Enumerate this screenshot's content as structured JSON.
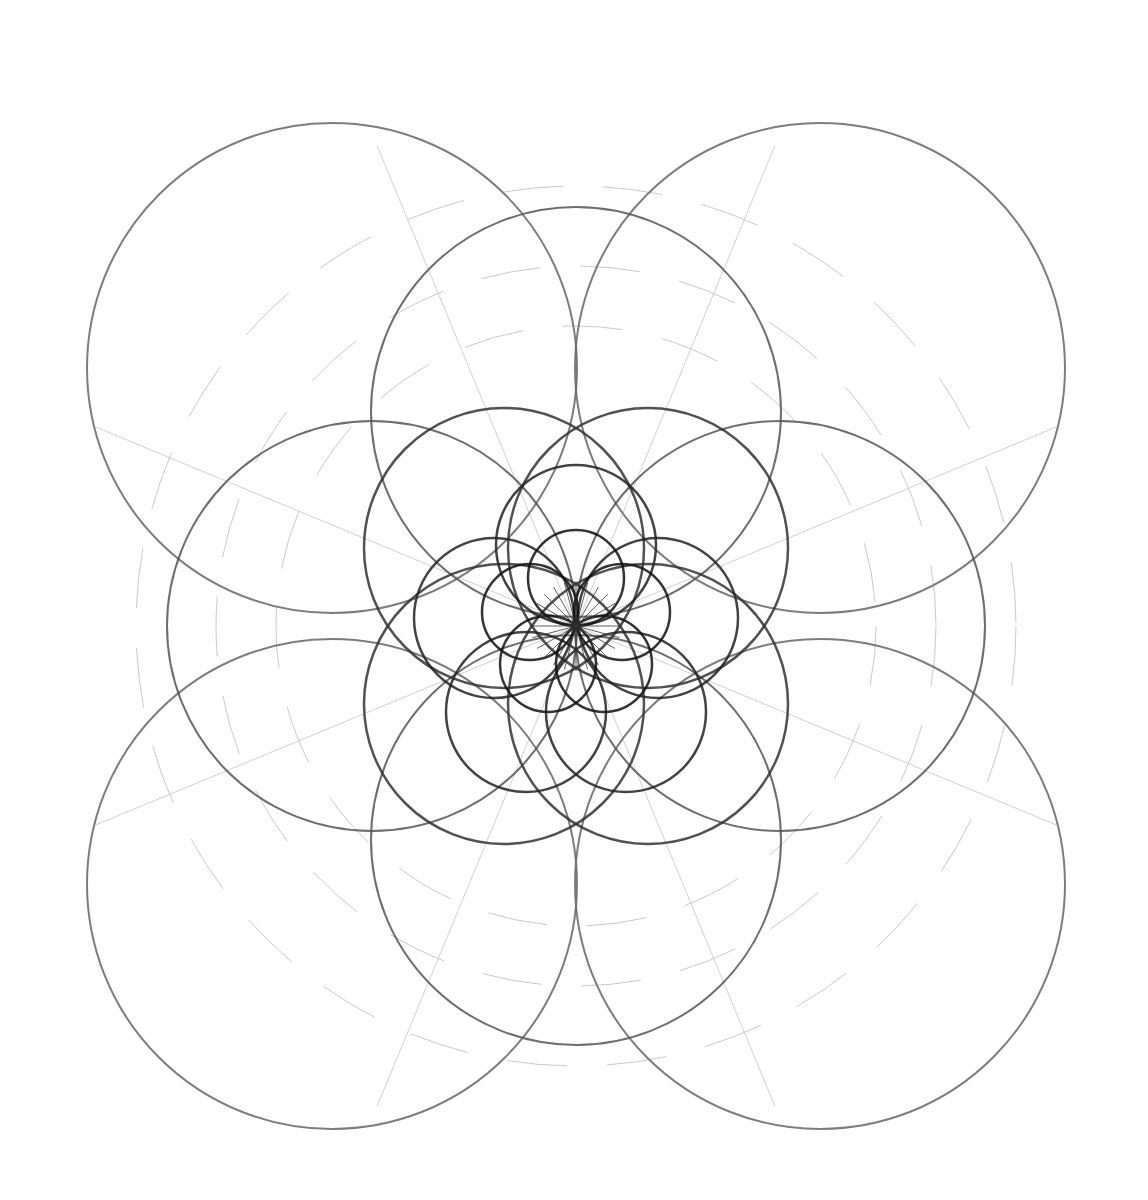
{
  "image": {
    "description": "Pencil geometric construction of nested overlapping circles in 4-fold, then 6-fold rosettes",
    "background": "#ffffff",
    "stroke_dark": "#555555",
    "stroke_light": "#bbbbbb",
    "center": [
      576,
      626
    ]
  },
  "rings": [
    {
      "name": "outer-four-circles",
      "r": 245,
      "centers": [
        [
          332,
          368
        ],
        [
          820,
          368
        ],
        [
          332,
          884
        ],
        [
          820,
          884
        ]
      ],
      "width": 2,
      "color": "#666666"
    },
    {
      "name": "second-four-circles",
      "r": 205,
      "centers": [
        [
          576,
          412
        ],
        [
          780,
          626
        ],
        [
          576,
          840
        ],
        [
          372,
          626
        ]
      ],
      "width": 2,
      "color": "#555555"
    },
    {
      "name": "third-four-circles",
      "r": 140,
      "centers": [
        [
          504,
          548
        ],
        [
          648,
          548
        ],
        [
          504,
          704
        ],
        [
          648,
          704
        ]
      ],
      "width": 2.5,
      "color": "#333333"
    },
    {
      "name": "fourth-circles",
      "r": 80,
      "centers": [
        [
          576,
          545
        ],
        [
          658,
          618
        ],
        [
          626,
          712
        ],
        [
          526,
          712
        ],
        [
          494,
          618
        ]
      ],
      "width": 2.5,
      "color": "#222222"
    },
    {
      "name": "inner-circles",
      "r": 48,
      "centers": [
        [
          576,
          578
        ],
        [
          622,
          612
        ],
        [
          604,
          664
        ],
        [
          548,
          664
        ],
        [
          530,
          612
        ]
      ],
      "width": 2.5,
      "color": "#111111"
    }
  ],
  "construction_arcs": [
    {
      "cx": 576,
      "cy": 626,
      "r": 440
    },
    {
      "cx": 576,
      "cy": 626,
      "r": 360
    },
    {
      "cx": 576,
      "cy": 626,
      "r": 300
    }
  ]
}
